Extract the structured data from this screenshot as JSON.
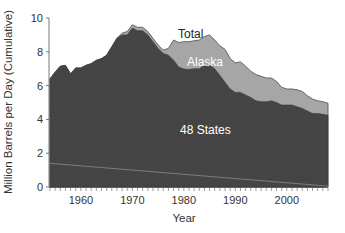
{
  "chart_data": {
    "type": "area",
    "stacked": true,
    "title": "",
    "xlabel": "Year",
    "ylabel": "Million Barrels per Day (Cumulative)",
    "xlim": [
      1954,
      2008
    ],
    "ylim": [
      0,
      10
    ],
    "x_ticks": [
      1960,
      1970,
      1980,
      1990,
      2000
    ],
    "y_ticks": [
      0,
      2,
      4,
      6,
      8,
      10
    ],
    "grid": false,
    "legend": "inline labels",
    "annotations": [
      "Total",
      "Alaska",
      "48 States"
    ],
    "x": [
      1954,
      1955,
      1956,
      1957,
      1958,
      1959,
      1960,
      1961,
      1962,
      1963,
      1964,
      1965,
      1966,
      1967,
      1968,
      1969,
      1970,
      1971,
      1972,
      1973,
      1974,
      1975,
      1976,
      1977,
      1978,
      1979,
      1980,
      1981,
      1982,
      1983,
      1984,
      1985,
      1986,
      1987,
      1988,
      1989,
      1990,
      1991,
      1992,
      1993,
      1994,
      1995,
      1996,
      1997,
      1998,
      1999,
      2000,
      2001,
      2002,
      2003,
      2004,
      2005,
      2006,
      2007,
      2008
    ],
    "series": [
      {
        "name": "48 States",
        "color": "#474747",
        "values": [
          6.4,
          6.8,
          7.15,
          7.2,
          6.7,
          7.05,
          7.05,
          7.2,
          7.3,
          7.5,
          7.6,
          7.8,
          8.3,
          8.8,
          9.0,
          9.0,
          9.4,
          9.25,
          9.25,
          9.0,
          8.6,
          8.2,
          7.9,
          7.8,
          7.5,
          7.1,
          6.98,
          6.95,
          7.0,
          7.0,
          7.2,
          7.2,
          7.0,
          6.6,
          6.2,
          5.8,
          5.6,
          5.6,
          5.45,
          5.3,
          5.1,
          5.05,
          5.05,
          5.1,
          5.0,
          4.85,
          4.85,
          4.85,
          4.75,
          4.65,
          4.5,
          4.35,
          4.35,
          4.3,
          4.25
        ]
      },
      {
        "name": "Alaska",
        "color": "#a6a6a6",
        "values": [
          0,
          0,
          0,
          0,
          0,
          0,
          0,
          0,
          0,
          0,
          0,
          0,
          0,
          0,
          0.1,
          0.2,
          0.2,
          0.2,
          0.2,
          0.2,
          0.2,
          0.2,
          0.2,
          0.4,
          1.2,
          1.45,
          1.62,
          1.65,
          1.65,
          1.7,
          1.7,
          1.8,
          1.7,
          1.75,
          1.95,
          1.8,
          1.75,
          1.8,
          1.7,
          1.55,
          1.55,
          1.5,
          1.4,
          1.35,
          1.25,
          1.05,
          0.95,
          0.95,
          1.0,
          1.0,
          0.9,
          0.85,
          0.75,
          0.75,
          0.7
        ]
      },
      {
        "name": "Total",
        "color": "#555555",
        "values": [
          6.4,
          6.8,
          7.15,
          7.2,
          6.7,
          7.05,
          7.05,
          7.2,
          7.3,
          7.5,
          7.6,
          7.8,
          8.3,
          8.8,
          9.1,
          9.2,
          9.6,
          9.45,
          9.45,
          9.2,
          8.8,
          8.4,
          8.1,
          8.2,
          8.7,
          8.55,
          8.6,
          8.6,
          8.65,
          8.7,
          8.9,
          9.0,
          8.7,
          8.35,
          8.15,
          7.6,
          7.35,
          7.4,
          7.15,
          6.85,
          6.65,
          6.55,
          6.45,
          6.45,
          6.25,
          5.9,
          5.8,
          5.8,
          5.75,
          5.65,
          5.4,
          5.2,
          5.1,
          5.05,
          4.95
        ]
      }
    ],
    "reference_line": {
      "color": "#8a8a8a",
      "from": [
        1954,
        1.4
      ],
      "to": [
        2008,
        0.05
      ]
    }
  },
  "labels": {
    "total": "Total",
    "alaska": "Alaska",
    "states48": "48 States",
    "xlabel": "Year",
    "ylabel": "Million Barrels per Day (Cumulative)"
  }
}
